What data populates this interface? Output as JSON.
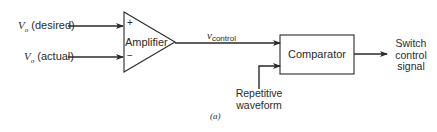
{
  "diagram": {
    "inputs": {
      "desired": {
        "symbol": "V",
        "subscript": "o",
        "text": "(desired)"
      },
      "actual": {
        "symbol": "V",
        "subscript": "o",
        "text": "(actual)"
      }
    },
    "amplifier": {
      "label": "Amplifier",
      "plus": "+",
      "minus": "−"
    },
    "control_signal": {
      "symbol": "v",
      "subscript": "control"
    },
    "comparator": {
      "label": "Comparator"
    },
    "repetitive": {
      "line1": "Repetitive",
      "line2": "waveform"
    },
    "output": {
      "line1": "Switch",
      "line2": "control",
      "line3": "signal"
    },
    "caption": "(a)",
    "colors": {
      "stroke": "#2a2a2a",
      "background": "#ffffff"
    }
  }
}
